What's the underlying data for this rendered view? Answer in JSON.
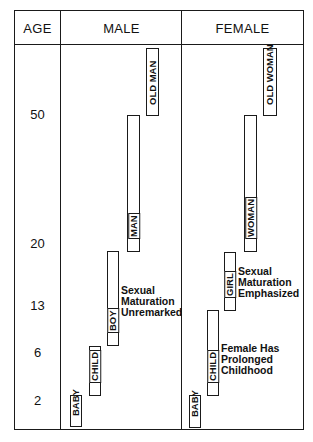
{
  "headers": {
    "age": "AGE",
    "male": "MALE",
    "female": "FEMALE"
  },
  "ages": [
    {
      "label": "50",
      "y": 107
    },
    {
      "label": "20",
      "y": 236
    },
    {
      "label": "13",
      "y": 298
    },
    {
      "label": "6",
      "y": 345
    },
    {
      "label": "2",
      "y": 393
    }
  ],
  "male": {
    "bars": [
      {
        "label": "OLD MAN",
        "x": 146,
        "y": 48,
        "w": 13,
        "h": 68,
        "labelled_full": true
      },
      {
        "label": "MAN",
        "x": 127,
        "y": 115,
        "w": 13,
        "h": 137
      },
      {
        "label": "BOY",
        "x": 107,
        "y": 251,
        "w": 12,
        "h": 95
      },
      {
        "label": "CHILD",
        "x": 89,
        "y": 346,
        "w": 12,
        "h": 50
      },
      {
        "label": "BABY",
        "x": 70,
        "y": 395,
        "w": 12,
        "h": 32,
        "labelled_full": true
      }
    ],
    "note": {
      "lines": [
        "Sexual",
        "Maturation",
        "Unremarked"
      ],
      "x": 121,
      "y": 285
    }
  },
  "female": {
    "bars": [
      {
        "label": "OLD WOMAN",
        "x": 263,
        "y": 48,
        "w": 14,
        "h": 68,
        "labelled_full": true
      },
      {
        "label": "WOMAN",
        "x": 244,
        "y": 115,
        "w": 13,
        "h": 137
      },
      {
        "label": "GIRL",
        "x": 224,
        "y": 252,
        "w": 12,
        "h": 59
      },
      {
        "label": "CHILD",
        "x": 207,
        "y": 310,
        "w": 12,
        "h": 86
      },
      {
        "label": "BABY",
        "x": 189,
        "y": 395,
        "w": 12,
        "h": 33,
        "labelled_full": true
      }
    ],
    "notes": [
      {
        "lines": [
          "Sexual",
          "Maturation",
          "Emphasized"
        ],
        "x": 238,
        "y": 266
      },
      {
        "lines": [
          "Female Has",
          "Prolonged",
          "Childhood"
        ],
        "x": 221,
        "y": 343
      }
    ]
  }
}
